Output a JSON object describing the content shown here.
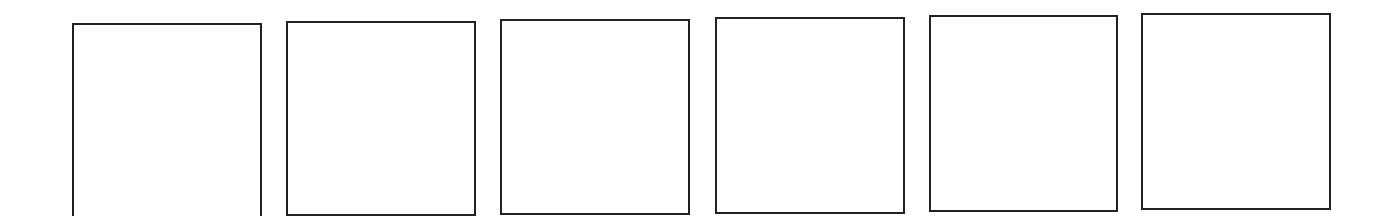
{
  "figure": {
    "stroke_color": "#222222",
    "background_color": "#ffffff",
    "boxes": [
      {
        "index": 1,
        "left": 72,
        "top": 23,
        "width": 190,
        "height": 200
      },
      {
        "index": 2,
        "left": 286,
        "top": 21,
        "width": 190,
        "height": 195
      },
      {
        "index": 3,
        "left": 500,
        "top": 19,
        "width": 190,
        "height": 196
      },
      {
        "index": 4,
        "left": 715,
        "top": 17,
        "width": 190,
        "height": 197
      },
      {
        "index": 5,
        "left": 929,
        "top": 15,
        "width": 189,
        "height": 197
      },
      {
        "index": 6,
        "left": 1141,
        "top": 13,
        "width": 190,
        "height": 197
      }
    ]
  }
}
